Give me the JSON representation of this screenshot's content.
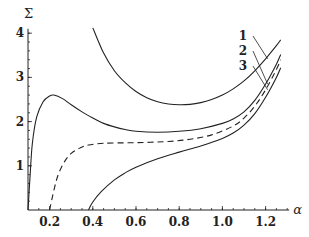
{
  "chart_data": {
    "type": "line",
    "title": "",
    "xlabel": "α",
    "ylabel": "Σ",
    "xlim": [
      0.1,
      1.3
    ],
    "ylim": [
      0,
      4.1
    ],
    "grid": false,
    "xticks": [
      {
        "value": 0.2,
        "label": "0.2"
      },
      {
        "value": 0.4,
        "label": "0.4"
      },
      {
        "value": 0.6,
        "label": "0.6"
      },
      {
        "value": 0.8,
        "label": "0.8"
      },
      {
        "value": 1.0,
        "label": "1.0"
      },
      {
        "value": 1.2,
        "label": "1.2"
      }
    ],
    "yticks": [
      {
        "value": 1,
        "label": "1"
      },
      {
        "value": 2,
        "label": "2"
      },
      {
        "value": 3,
        "label": "3"
      },
      {
        "value": 4,
        "label": "4"
      }
    ],
    "series": [
      {
        "name": "1",
        "style": "solid",
        "points": [
          [
            0.4,
            4.12
          ],
          [
            0.45,
            3.55
          ],
          [
            0.5,
            3.15
          ],
          [
            0.55,
            2.88
          ],
          [
            0.6,
            2.68
          ],
          [
            0.65,
            2.54
          ],
          [
            0.7,
            2.45
          ],
          [
            0.75,
            2.4
          ],
          [
            0.8,
            2.38
          ],
          [
            0.85,
            2.39
          ],
          [
            0.9,
            2.43
          ],
          [
            0.95,
            2.5
          ],
          [
            1.0,
            2.6
          ],
          [
            1.05,
            2.74
          ],
          [
            1.1,
            2.92
          ],
          [
            1.15,
            3.15
          ],
          [
            1.2,
            3.42
          ],
          [
            1.25,
            3.72
          ],
          [
            1.27,
            3.85
          ]
        ]
      },
      {
        "name": "2",
        "style": "solid",
        "points": [
          [
            0.1,
            0.0
          ],
          [
            0.11,
            0.8
          ],
          [
            0.12,
            1.5
          ],
          [
            0.14,
            2.1
          ],
          [
            0.17,
            2.45
          ],
          [
            0.2,
            2.58
          ],
          [
            0.22,
            2.6
          ],
          [
            0.26,
            2.52
          ],
          [
            0.3,
            2.38
          ],
          [
            0.35,
            2.22
          ],
          [
            0.4,
            2.08
          ],
          [
            0.45,
            1.96
          ],
          [
            0.5,
            1.88
          ],
          [
            0.55,
            1.82
          ],
          [
            0.6,
            1.78
          ],
          [
            0.7,
            1.76
          ],
          [
            0.8,
            1.78
          ],
          [
            0.9,
            1.84
          ],
          [
            1.0,
            1.96
          ],
          [
            1.05,
            2.06
          ],
          [
            1.1,
            2.22
          ],
          [
            1.15,
            2.48
          ],
          [
            1.2,
            2.85
          ],
          [
            1.25,
            3.3
          ],
          [
            1.27,
            3.52
          ]
        ]
      },
      {
        "name": "3",
        "style": "dashed",
        "points": [
          [
            0.2,
            0.0
          ],
          [
            0.22,
            0.45
          ],
          [
            0.24,
            0.8
          ],
          [
            0.27,
            1.1
          ],
          [
            0.3,
            1.28
          ],
          [
            0.34,
            1.4
          ],
          [
            0.38,
            1.47
          ],
          [
            0.45,
            1.51
          ],
          [
            0.55,
            1.52
          ],
          [
            0.65,
            1.53
          ],
          [
            0.75,
            1.55
          ],
          [
            0.85,
            1.6
          ],
          [
            0.95,
            1.7
          ],
          [
            1.05,
            1.9
          ],
          [
            1.1,
            2.08
          ],
          [
            1.15,
            2.35
          ],
          [
            1.2,
            2.72
          ],
          [
            1.25,
            3.18
          ],
          [
            1.27,
            3.4
          ]
        ]
      },
      {
        "name": "",
        "style": "solid",
        "points": [
          [
            0.38,
            0.0
          ],
          [
            0.4,
            0.18
          ],
          [
            0.44,
            0.42
          ],
          [
            0.5,
            0.68
          ],
          [
            0.55,
            0.84
          ],
          [
            0.6,
            0.97
          ],
          [
            0.7,
            1.16
          ],
          [
            0.8,
            1.31
          ],
          [
            0.9,
            1.45
          ],
          [
            1.0,
            1.62
          ],
          [
            1.05,
            1.74
          ],
          [
            1.1,
            1.92
          ],
          [
            1.15,
            2.18
          ],
          [
            1.2,
            2.55
          ],
          [
            1.25,
            3.0
          ],
          [
            1.27,
            3.22
          ]
        ]
      }
    ],
    "annotations": [
      {
        "text": "1",
        "target_series": "1"
      },
      {
        "text": "2",
        "target_series": "2"
      },
      {
        "text": "3",
        "target_series": "3"
      }
    ]
  }
}
